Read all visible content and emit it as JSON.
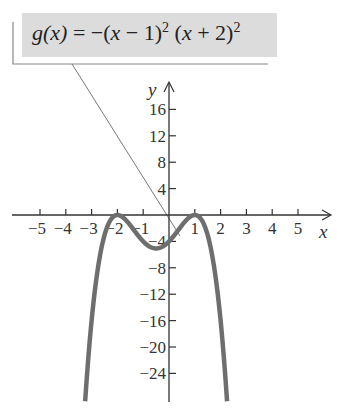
{
  "chart_data": {
    "type": "line",
    "function": "g(x) = -(x - 1)^2 (x + 2)^2",
    "xlabel": "x",
    "ylabel": "y",
    "xlim": [
      -5.8,
      6.2
    ],
    "ylim": [
      -28.3,
      20
    ],
    "grid": false,
    "legend": "none",
    "x_ticks": [
      -5,
      -4,
      -3,
      -2,
      -1,
      1,
      2,
      3,
      4,
      5
    ],
    "x_tick_labels": [
      "−5",
      "−4",
      "−3",
      "−2",
      "−1",
      "1",
      "2",
      "3",
      "4",
      "5"
    ],
    "y_ticks": [
      16,
      12,
      8,
      4,
      -4,
      -8,
      -12,
      -16,
      -20,
      -24
    ],
    "y_tick_labels": [
      "16",
      "12",
      "8",
      "4",
      "−4",
      "−8",
      "−12",
      "−16",
      "−20",
      "−24"
    ],
    "series": [
      {
        "name": "g(x)",
        "color": "#6e6e6e",
        "x": [
          -3.25,
          -3.0,
          -2.75,
          -2.5,
          -2.25,
          -2.0,
          -1.75,
          -1.5,
          -1.25,
          -1.0,
          -0.75,
          -0.5,
          -0.25,
          0.0,
          0.25,
          0.5,
          0.75,
          1.0,
          1.25,
          1.5,
          1.75,
          2.0,
          2.25
        ],
        "values": [
          -28.2,
          -16.0,
          -8.5,
          -3.06,
          -0.66,
          0.0,
          -0.48,
          -1.56,
          -2.85,
          -4.0,
          -4.73,
          -5.06,
          -4.95,
          -4.0,
          -3.16,
          -1.56,
          -0.47,
          0.0,
          -0.66,
          -3.06,
          -8.5,
          -16.0,
          -28.2
        ]
      }
    ],
    "key_points": [
      {
        "x": -2,
        "y": 0,
        "label": "local max"
      },
      {
        "x": 1,
        "y": 0,
        "label": "local max"
      },
      {
        "x": -0.5,
        "y": -5.06,
        "label": "local min"
      },
      {
        "x": 0,
        "y": -4,
        "label": "y-intercept"
      }
    ],
    "annotation": {
      "text": "g(x) = −(x − 1)² (x + 2)²",
      "points_to": "curve"
    }
  },
  "callout": {
    "lhs": "g(x)",
    "eq": " = −(",
    "x1": "x",
    "m1": " − 1)",
    "sup1": "2",
    "p2": " (",
    "x2": "x",
    "m2": " + 2)",
    "sup2": "2"
  },
  "style": {
    "curve_color": "#6e6e6e",
    "axis_color": "#333333",
    "callout_bg": "#dcdcdc"
  }
}
